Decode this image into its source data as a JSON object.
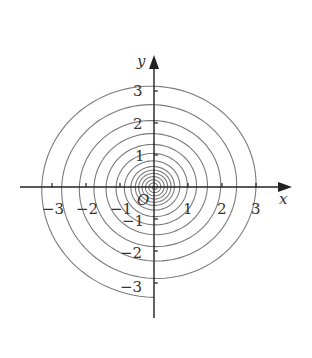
{
  "figure": {
    "type": "spiral-curve-plot",
    "x_axis_label": "x",
    "y_axis_label": "y",
    "origin_label": "O",
    "x_ticks": [
      {
        "value": -3,
        "label": "−3"
      },
      {
        "value": -2,
        "label": "−2"
      },
      {
        "value": -1,
        "label": "−1"
      },
      {
        "value": 1,
        "label": "1"
      },
      {
        "value": 2,
        "label": "2"
      },
      {
        "value": 3,
        "label": "3"
      }
    ],
    "y_ticks": [
      {
        "value": 3,
        "label": "3"
      },
      {
        "value": 2,
        "label": "2"
      },
      {
        "value": 1,
        "label": "1"
      },
      {
        "value": -1,
        "label": "−1"
      },
      {
        "value": -2,
        "label": "−2"
      },
      {
        "value": -3,
        "label": "−3"
      }
    ],
    "colors": {
      "axis": "#222222",
      "curve": "#7a7a7a",
      "text": "#333333"
    }
  },
  "chart_data": {
    "type": "line",
    "title": "",
    "xlabel": "x",
    "ylabel": "y",
    "xlim": [
      -3.9,
      4.0
    ],
    "ylim": [
      -4.0,
      4.1
    ],
    "grid": false,
    "positive_x_axis_crossings": [
      0.1,
      0.2,
      0.3,
      0.4,
      0.5,
      0.6,
      0.76,
      0.98,
      1.25,
      1.57,
      1.96,
      2.43,
      3.0
    ],
    "outer_end_point": [
      0.1,
      -3.45
    ],
    "outer_loop_radii": {
      "right": 3.0,
      "top": 3.05,
      "left": 3.3,
      "bottom": 3.45
    }
  }
}
